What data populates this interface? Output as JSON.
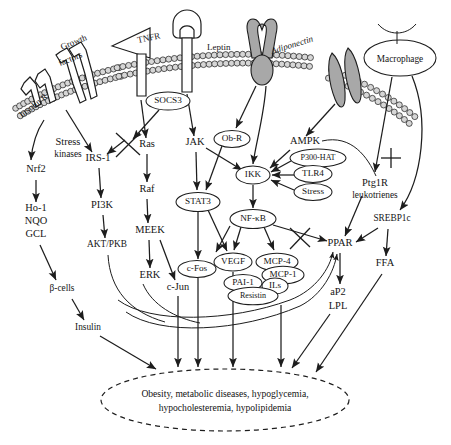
{
  "figure": {
    "membrane_label": "phospholipid-bilayer"
  },
  "receptors": [
    {
      "id": "insulin-r",
      "label": "Insulin R",
      "x": 52,
      "y": 96,
      "rot": -38
    },
    {
      "id": "growth-factors",
      "label": "Growth\nfactors",
      "line1": "Growth",
      "line2": "factors",
      "x": 88,
      "y": 56,
      "rot": -22
    },
    {
      "id": "tnfr",
      "label": "TNFR",
      "x": 160,
      "y": 48,
      "rot": -12
    },
    {
      "id": "leptin",
      "label": "Leptin",
      "x": 228,
      "y": 44,
      "rot": 0
    },
    {
      "id": "adiponectin",
      "label": "Adiponectin",
      "x": 300,
      "y": 53,
      "rot": -17
    },
    {
      "id": "macrophage",
      "label": "Macrophage",
      "x": 406,
      "y": 58,
      "rot": 0
    }
  ],
  "nodes_ellipse": [
    {
      "id": "socs3",
      "label": "SOCS3",
      "cx": 168,
      "cy": 101,
      "rx": 22,
      "ry": 9
    },
    {
      "id": "obr",
      "label": "Ob-R",
      "cx": 232,
      "cy": 139,
      "rx": 18,
      "ry": 8.5
    },
    {
      "id": "stat3",
      "label": "STAT3",
      "cx": 198,
      "cy": 202,
      "rx": 22,
      "ry": 9.5
    },
    {
      "id": "ikk",
      "label": "IKK",
      "cx": 253,
      "cy": 175,
      "rx": 17,
      "ry": 9
    },
    {
      "id": "p300hat",
      "label": "P300-HAT",
      "cx": 318,
      "cy": 158,
      "rx": 28,
      "ry": 9
    },
    {
      "id": "tlr4",
      "label": "TLR4",
      "cx": 313,
      "cy": 174,
      "rx": 19,
      "ry": 8.5
    },
    {
      "id": "stress-ox",
      "label": "Stress",
      "cx": 313,
      "cy": 192,
      "rx": 19,
      "ry": 8.5
    },
    {
      "id": "nfkb",
      "label": "NF-κB",
      "cx": 253,
      "cy": 219,
      "rx": 23,
      "ry": 9.5
    },
    {
      "id": "cfos",
      "label": "c-Fos",
      "cx": 197,
      "cy": 269,
      "rx": 19,
      "ry": 8.5
    },
    {
      "id": "vegf",
      "label": "VEGF",
      "cx": 233,
      "cy": 262,
      "rx": 19,
      "ry": 9
    },
    {
      "id": "mcp4",
      "label": "MCP-4",
      "cx": 277,
      "cy": 262,
      "rx": 21,
      "ry": 8.7
    },
    {
      "id": "mcp1",
      "label": "MCP-1",
      "cx": 283,
      "cy": 275,
      "rx": 21,
      "ry": 8.7
    },
    {
      "id": "pai1",
      "label": "PAI-1",
      "cx": 243,
      "cy": 283,
      "rx": 19,
      "ry": 8.5
    },
    {
      "id": "ils",
      "label": "ILs",
      "cx": 275,
      "cy": 286,
      "rx": 13,
      "ry": 8
    },
    {
      "id": "resistin",
      "label": "Resistin",
      "cx": 253,
      "cy": 296,
      "rx": 25,
      "ry": 8.7
    }
  ],
  "nodes_plain": [
    {
      "id": "stress-kinases",
      "label": "Stress",
      "label2": "kinases",
      "x": 68,
      "y": 145
    },
    {
      "id": "nrf2",
      "label": "Nrf2",
      "x": 36,
      "y": 172
    },
    {
      "id": "ho1",
      "label": "Ho-1",
      "x": 36,
      "y": 211
    },
    {
      "id": "nqo",
      "label": "NQO",
      "x": 36,
      "y": 224
    },
    {
      "id": "gcl",
      "label": "GCL",
      "x": 36,
      "y": 237
    },
    {
      "id": "bcells",
      "label": "β-cells",
      "x": 62,
      "y": 291
    },
    {
      "id": "insulin",
      "label": "Insulin",
      "x": 88,
      "y": 330
    },
    {
      "id": "irs1",
      "label": "IRS-1",
      "x": 98,
      "y": 161
    },
    {
      "id": "pi3k",
      "label": "PI3K",
      "x": 102,
      "y": 208
    },
    {
      "id": "aktpkb",
      "label": "AKT/PKB",
      "x": 107,
      "y": 247
    },
    {
      "id": "ras",
      "label": "Ras",
      "x": 147,
      "y": 147
    },
    {
      "id": "raf",
      "label": "Raf",
      "x": 147,
      "y": 192
    },
    {
      "id": "meek",
      "label": "MEEK",
      "x": 150,
      "y": 233
    },
    {
      "id": "erk",
      "label": "ERK",
      "x": 150,
      "y": 278
    },
    {
      "id": "cjun",
      "label": "c-Jun",
      "x": 178,
      "y": 290
    },
    {
      "id": "jak",
      "label": "JAK",
      "x": 195,
      "y": 145
    },
    {
      "id": "ampk",
      "label": "AMPK",
      "x": 305,
      "y": 144
    },
    {
      "id": "ptg1r",
      "label": "Ptg1R",
      "label2": "leukotrienes",
      "x": 375,
      "y": 186
    },
    {
      "id": "srebp1c",
      "label": "SREBP1c",
      "x": 392,
      "y": 221
    },
    {
      "id": "ppar",
      "label": "PPAR",
      "x": 340,
      "y": 246
    },
    {
      "id": "ffa",
      "label": "FFA",
      "x": 385,
      "y": 266
    },
    {
      "id": "ap2",
      "label": "aP2",
      "x": 338,
      "y": 295
    },
    {
      "id": "lpl",
      "label": "LPL",
      "x": 338,
      "y": 309
    }
  ],
  "outcome": {
    "id": "outcome-ellipse",
    "line1": "Obesity, metabolic diseases, hypoglycemia,",
    "line2": "hypocholesteremia, hypolipidemia",
    "cx": 225,
    "cy": 400,
    "rx": 124,
    "ry": 31
  },
  "inhibitions": [
    {
      "id": "inhibit-irs1-ras",
      "x": 127,
      "y": 144
    },
    {
      "id": "inhibit-nfkb-ppar",
      "x": 300,
      "y": 237
    },
    {
      "id": "inhibit-macrophage-srebp1c",
      "x": 390,
      "y": 166
    }
  ],
  "colors": {
    "ink": "#1d1d1d",
    "membrane_fill": "#d6d6d6",
    "receptor_gray": "#a8a8a8",
    "background": "#ffffff"
  }
}
